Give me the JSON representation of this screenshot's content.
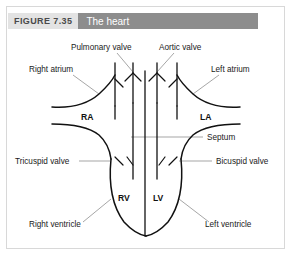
{
  "figure": {
    "number": "FIGURE 7.35",
    "title": "The heart"
  },
  "labels": {
    "pulmonary_valve": "Pulmonary valve",
    "aortic_valve": "Aortic valve",
    "right_atrium": "Right atrium",
    "left_atrium": "Left atrium",
    "ra": "RA",
    "la": "LA",
    "septum": "Septum",
    "tricuspid_valve": "Tricuspid valve",
    "bicuspid_valve": "Bicuspid valve",
    "rv": "RV",
    "lv": "LV",
    "right_ventricle": "Right ventricle",
    "left_ventricle": "Left ventricle"
  },
  "colors": {
    "figure_number_bg": "#e3e3e3",
    "figure_number_text": "#4a4a4a",
    "title_band_bg": "#8d8d8d",
    "title_band_text": "#ffffff",
    "card_border": "#d8d8d8",
    "diagram_stroke": "#111111",
    "leader_stroke": "#808080",
    "page_bg": "#ffffff"
  }
}
